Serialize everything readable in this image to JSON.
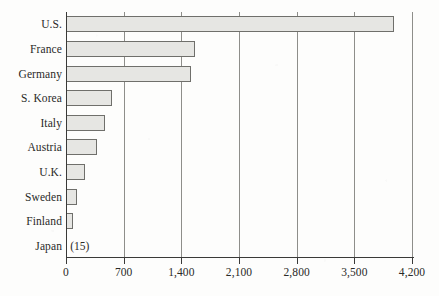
{
  "chart_data": {
    "type": "bar",
    "orientation": "horizontal",
    "title": "",
    "subtitle": "",
    "xlabel": "",
    "ylabel": "",
    "categories": [
      "U.S.",
      "France",
      "Germany",
      "S. Korea",
      "Italy",
      "Austria",
      "U.K.",
      "Sweden",
      "Finland",
      "Japan"
    ],
    "values": [
      3980,
      1560,
      1520,
      555,
      470,
      375,
      230,
      133,
      85,
      15
    ],
    "value_labels": [
      "",
      "",
      "",
      "",
      "",
      "",
      "",
      "",
      "",
      "(15)"
    ],
    "xlim": [
      0,
      4200
    ],
    "ticks": [
      0,
      700,
      1400,
      2100,
      2800,
      3500,
      4200
    ],
    "tick_labels": [
      "0",
      "700",
      "1,400",
      "2,100",
      "2,800",
      "3,500",
      "4,200"
    ],
    "grid": true,
    "grid_axis": "x",
    "legend": false,
    "legend_position": "none",
    "bar_fill": "#e6e6e3",
    "bar_border": "#6f6f6b",
    "axis_color": "#3a3a38",
    "grid_color": "#8e8e8a",
    "text_color": "#2a2a28",
    "background": "#fdfdfc"
  }
}
